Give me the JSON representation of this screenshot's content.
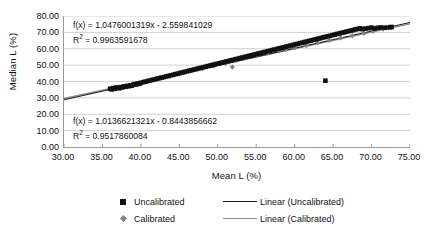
{
  "chart_data": {
    "type": "scatter",
    "title": "",
    "xlabel": "Mean L (%)",
    "ylabel": "Median L (%)",
    "xlim": [
      30,
      75
    ],
    "ylim": [
      0,
      80
    ],
    "xticks": [
      "30.00",
      "35.00",
      "40.00",
      "45.00",
      "50.00",
      "55.00",
      "60.00",
      "65.00",
      "70.00",
      "75.00"
    ],
    "yticks": [
      "0.00",
      "10.00",
      "20.00",
      "30.00",
      "40.00",
      "50.00",
      "60.00",
      "70.00",
      "80.00"
    ],
    "xtick_values": [
      30,
      35,
      40,
      45,
      50,
      55,
      60,
      65,
      70,
      75
    ],
    "ytick_values": [
      0,
      10,
      20,
      30,
      40,
      50,
      60,
      70,
      80
    ],
    "grid": "horizontal",
    "legend_position": "bottom",
    "annotations": [
      {
        "name": "equation-uncalibrated",
        "equation": "f(x) = 1.0476001319x - 2.559841029",
        "r2_prefix": "R",
        "r2_exp": "2",
        "r2_value": " = 0.9963591678",
        "slope": 1.0476001319,
        "intercept": -2.559841029,
        "r2": 0.9963591678
      },
      {
        "name": "equation-calibrated",
        "equation": "f(x) = 1.0136621321x - 0.8443856662",
        "r2_prefix": "R",
        "r2_exp": "2",
        "r2_value": " = 0.9517860084",
        "slope": 1.0136621321,
        "intercept": -0.8443856662,
        "r2": 0.9517860084
      }
    ],
    "series": [
      {
        "name": "Uncalibrated",
        "marker": "square",
        "color": "#111111",
        "points": [
          [
            36.0,
            35.6
          ],
          [
            36.2,
            35.2
          ],
          [
            36.4,
            36.0
          ],
          [
            36.6,
            35.5
          ],
          [
            36.8,
            36.3
          ],
          [
            37.0,
            36.1
          ],
          [
            37.2,
            35.9
          ],
          [
            37.4,
            36.6
          ],
          [
            37.6,
            36.4
          ],
          [
            37.8,
            37.0
          ],
          [
            38.0,
            36.8
          ],
          [
            38.2,
            37.3
          ],
          [
            38.4,
            37.1
          ],
          [
            38.6,
            37.6
          ],
          [
            38.8,
            37.4
          ],
          [
            39.0,
            38.0
          ],
          [
            39.2,
            38.4
          ],
          [
            39.4,
            38.2
          ],
          [
            39.6,
            38.8
          ],
          [
            39.8,
            38.6
          ],
          [
            40.0,
            39.2
          ],
          [
            40.3,
            39.6
          ],
          [
            40.6,
            39.9
          ],
          [
            40.9,
            40.3
          ],
          [
            41.2,
            40.6
          ],
          [
            41.5,
            41.0
          ],
          [
            41.8,
            41.3
          ],
          [
            42.1,
            41.7
          ],
          [
            42.4,
            42.0
          ],
          [
            42.7,
            42.4
          ],
          [
            43.0,
            42.7
          ],
          [
            43.3,
            43.1
          ],
          [
            43.6,
            43.4
          ],
          [
            43.9,
            43.8
          ],
          [
            44.2,
            44.1
          ],
          [
            44.5,
            44.5
          ],
          [
            44.8,
            44.8
          ],
          [
            45.1,
            45.2
          ],
          [
            45.4,
            45.5
          ],
          [
            45.7,
            45.9
          ],
          [
            46.0,
            46.2
          ],
          [
            46.3,
            46.6
          ],
          [
            46.6,
            46.9
          ],
          [
            46.9,
            47.3
          ],
          [
            47.2,
            47.6
          ],
          [
            47.5,
            48.0
          ],
          [
            47.8,
            48.3
          ],
          [
            48.1,
            48.7
          ],
          [
            48.4,
            49.0
          ],
          [
            48.7,
            49.4
          ],
          [
            49.0,
            49.7
          ],
          [
            49.3,
            50.1
          ],
          [
            49.6,
            50.4
          ],
          [
            49.9,
            50.8
          ],
          [
            50.2,
            51.1
          ],
          [
            50.5,
            51.5
          ],
          [
            50.8,
            51.8
          ],
          [
            51.1,
            52.2
          ],
          [
            51.4,
            52.5
          ],
          [
            51.7,
            52.9
          ],
          [
            52.0,
            53.2
          ],
          [
            52.3,
            53.6
          ],
          [
            52.6,
            53.9
          ],
          [
            52.9,
            54.3
          ],
          [
            53.2,
            54.6
          ],
          [
            53.5,
            55.0
          ],
          [
            53.8,
            55.3
          ],
          [
            54.1,
            55.7
          ],
          [
            54.4,
            56.0
          ],
          [
            54.7,
            56.4
          ],
          [
            55.0,
            56.7
          ],
          [
            55.3,
            57.1
          ],
          [
            55.6,
            57.4
          ],
          [
            55.9,
            57.8
          ],
          [
            56.2,
            58.1
          ],
          [
            56.5,
            58.5
          ],
          [
            56.8,
            58.8
          ],
          [
            57.1,
            59.2
          ],
          [
            57.4,
            59.5
          ],
          [
            57.7,
            59.9
          ],
          [
            58.0,
            60.2
          ],
          [
            58.3,
            60.6
          ],
          [
            58.6,
            60.9
          ],
          [
            58.9,
            61.3
          ],
          [
            59.2,
            61.6
          ],
          [
            59.5,
            62.0
          ],
          [
            59.8,
            62.3
          ],
          [
            60.1,
            62.7
          ],
          [
            60.4,
            63.0
          ],
          [
            60.7,
            63.4
          ],
          [
            61.0,
            63.7
          ],
          [
            61.3,
            64.1
          ],
          [
            61.6,
            64.4
          ],
          [
            61.9,
            64.8
          ],
          [
            62.2,
            65.1
          ],
          [
            62.5,
            65.5
          ],
          [
            62.8,
            65.8
          ],
          [
            63.1,
            66.2
          ],
          [
            63.4,
            66.5
          ],
          [
            63.7,
            66.9
          ],
          [
            64.0,
            67.2
          ],
          [
            64.3,
            67.6
          ],
          [
            64.6,
            67.9
          ],
          [
            64.9,
            68.3
          ],
          [
            65.2,
            68.6
          ],
          [
            65.5,
            69.0
          ],
          [
            65.8,
            69.3
          ],
          [
            66.1,
            69.7
          ],
          [
            66.4,
            70.0
          ],
          [
            66.7,
            70.4
          ],
          [
            67.0,
            70.7
          ],
          [
            67.3,
            71.1
          ],
          [
            67.6,
            71.4
          ],
          [
            67.9,
            71.8
          ],
          [
            68.2,
            72.1
          ],
          [
            68.5,
            72.5
          ],
          [
            68.8,
            72.0
          ],
          [
            69.2,
            72.3
          ],
          [
            69.6,
            72.6
          ],
          [
            70.0,
            72.9
          ],
          [
            70.4,
            72.4
          ],
          [
            70.8,
            72.8
          ],
          [
            71.2,
            73.0
          ],
          [
            71.8,
            72.9
          ],
          [
            72.4,
            73.1
          ],
          [
            72.6,
            73.3
          ],
          [
            64.0,
            40.5
          ]
        ],
        "outlier": {
          "x": 64.0,
          "y": 40.5,
          "note": "single low-median point"
        }
      },
      {
        "name": "Calibrated",
        "marker": "diamond",
        "color": "#808080",
        "points": [
          [
            36.3,
            35.8
          ],
          [
            38.5,
            37.5
          ],
          [
            40.5,
            40.0
          ],
          [
            42.0,
            41.6
          ],
          [
            43.8,
            43.5
          ],
          [
            44.2,
            44.0
          ],
          [
            45.0,
            44.7
          ],
          [
            46.5,
            46.4
          ],
          [
            48.0,
            48.0
          ],
          [
            49.5,
            49.5
          ],
          [
            51.0,
            51.0
          ],
          [
            51.9,
            48.8
          ],
          [
            52.4,
            53.0
          ],
          [
            53.5,
            54.2
          ],
          [
            55.0,
            55.8
          ],
          [
            56.5,
            57.3
          ],
          [
            58.0,
            58.8
          ],
          [
            58.8,
            59.5
          ],
          [
            60.0,
            60.5
          ],
          [
            61.5,
            62.0
          ],
          [
            63.0,
            63.6
          ],
          [
            64.5,
            65.1
          ],
          [
            66.0,
            66.6
          ],
          [
            67.5,
            68.0
          ],
          [
            69.0,
            69.5
          ],
          [
            70.2,
            70.8
          ],
          [
            71.5,
            72.0
          ],
          [
            72.2,
            72.8
          ]
        ]
      }
    ],
    "trendlines": [
      {
        "name": "Linear (Uncalibrated)",
        "color": "#1a1a1a",
        "slope": 1.0476001319,
        "intercept": -2.559841029,
        "x_from": 30,
        "x_to": 75
      },
      {
        "name": "Linear (Calibrated)",
        "color": "#8d8d8d",
        "slope": 1.0136621321,
        "intercept": -0.8443856662,
        "x_from": 30,
        "x_to": 75
      }
    ]
  },
  "legend": {
    "entries": [
      {
        "label": "Uncalibrated",
        "marker": "square-marker",
        "line_label": "Linear (Uncalibrated)",
        "line_style": "dark"
      },
      {
        "label": "Calibrated",
        "marker": "diamond-marker",
        "line_label": "Linear (Calibrated)",
        "line_style": "gray"
      }
    ]
  }
}
